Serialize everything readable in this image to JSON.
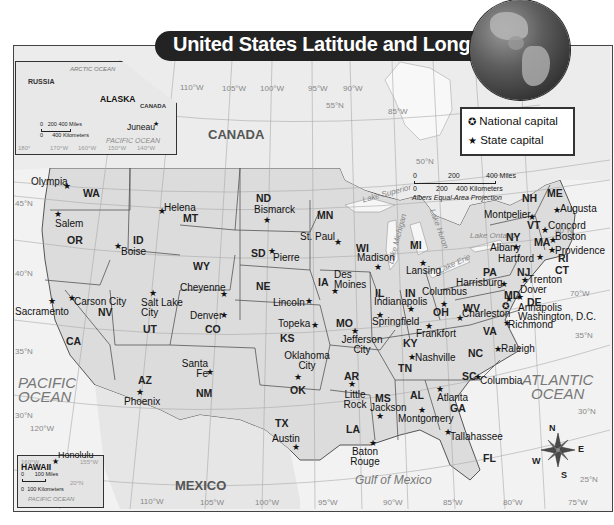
{
  "title": "United States Latitude and Longitude",
  "legend": {
    "items": [
      {
        "symbol": "national-capital-icon",
        "glyph": "✪",
        "label": "National capital"
      },
      {
        "symbol": "state-capital-icon",
        "glyph": "★",
        "label": "State capital"
      }
    ]
  },
  "scale_bar": {
    "miles": [
      "0",
      "200",
      "400 Miles"
    ],
    "kilometers": [
      "0",
      "200",
      "400 Kilometers"
    ],
    "projection": "Albers Equal-Area Projection"
  },
  "insets": {
    "alaska": {
      "state": "ALASKA",
      "neighbors": [
        "RUSSIA",
        "CANADA"
      ],
      "ocean": "PACIFIC OCEAN",
      "arctic": "ARCTIC OCEAN",
      "capital": "Juneau",
      "scale_miles": [
        "0",
        "200",
        "400 Miles"
      ],
      "scale_km": [
        "0",
        "400 Kilometers"
      ],
      "longitudes": [
        "180°",
        "170°W",
        "160°W",
        "150°W",
        "140°W"
      ]
    },
    "hawaii": {
      "state": "HAWAII",
      "capital": "Honolulu",
      "ocean": "PACIFIC OCEAN",
      "scale_miles": [
        "0",
        "100 Miles"
      ],
      "scale_km": [
        "0",
        "100 Kilometers"
      ],
      "longitudes": [
        "160°W",
        "155°W"
      ],
      "latitude": "20°N"
    }
  },
  "countries": [
    "CANADA",
    "MEXICO"
  ],
  "water_bodies": {
    "pacific": [
      "PACIFIC",
      "OCEAN"
    ],
    "atlantic": [
      "ATLANTIC",
      "OCEAN"
    ],
    "gulf": "Gulf of Mexico",
    "lakes": [
      "Lake Superior",
      "Lake Michigan",
      "Lake Huron",
      "Lake Erie",
      "Lake Ontario"
    ]
  },
  "gridlines": {
    "longitudes_top": [
      "110°W",
      "105°W",
      "100°W",
      "95°W",
      "90°W",
      "85°W"
    ],
    "longitudes_bottom": [
      "120°W",
      "110°W",
      "105°W",
      "100°W",
      "95°W",
      "90°W",
      "85°W",
      "80°W",
      "75°W",
      "70°W"
    ],
    "latitudes": [
      "55°N",
      "50°N",
      "45°N",
      "40°N",
      "35°N",
      "30°N",
      "25°N"
    ]
  },
  "compass": {
    "n": "N",
    "e": "E",
    "s": "S",
    "w": "W"
  },
  "states": [
    {
      "abbr": "WA",
      "capital": "Olympia"
    },
    {
      "abbr": "OR",
      "capital": "Salem"
    },
    {
      "abbr": "CA",
      "capital": "Sacramento"
    },
    {
      "abbr": "NV",
      "capital": "Carson City"
    },
    {
      "abbr": "ID",
      "capital": "Boise"
    },
    {
      "abbr": "MT",
      "capital": "Helena"
    },
    {
      "abbr": "WY",
      "capital": "Cheyenne"
    },
    {
      "abbr": "UT",
      "capital": "Salt Lake City"
    },
    {
      "abbr": "CO",
      "capital": "Denver"
    },
    {
      "abbr": "AZ",
      "capital": "Phoenix"
    },
    {
      "abbr": "NM",
      "capital": "Santa Fe"
    },
    {
      "abbr": "ND",
      "capital": "Bismarck"
    },
    {
      "abbr": "SD",
      "capital": "Pierre"
    },
    {
      "abbr": "NE",
      "capital": "Lincoln"
    },
    {
      "abbr": "KS",
      "capital": "Topeka"
    },
    {
      "abbr": "OK",
      "capital": "Oklahoma City"
    },
    {
      "abbr": "TX",
      "capital": "Austin"
    },
    {
      "abbr": "MN",
      "capital": "St. Paul"
    },
    {
      "abbr": "IA",
      "capital": "Des Moines"
    },
    {
      "abbr": "MO",
      "capital": "Jefferson City"
    },
    {
      "abbr": "AR",
      "capital": "Little Rock"
    },
    {
      "abbr": "LA",
      "capital": "Baton Rouge"
    },
    {
      "abbr": "WI",
      "capital": "Madison"
    },
    {
      "abbr": "IL",
      "capital": "Springfield"
    },
    {
      "abbr": "MS",
      "capital": "Jackson"
    },
    {
      "abbr": "MI",
      "capital": "Lansing"
    },
    {
      "abbr": "IN",
      "capital": "Indianapolis"
    },
    {
      "abbr": "KY",
      "capital": "Frankfort"
    },
    {
      "abbr": "TN",
      "capital": "Nashville"
    },
    {
      "abbr": "AL",
      "capital": "Montgomery"
    },
    {
      "abbr": "OH",
      "capital": "Columbus"
    },
    {
      "abbr": "GA",
      "capital": "Atlanta"
    },
    {
      "abbr": "FL",
      "capital": "Tallahassee"
    },
    {
      "abbr": "SC",
      "capital": "Columbia"
    },
    {
      "abbr": "NC",
      "capital": "Raleigh"
    },
    {
      "abbr": "VA",
      "capital": "Richmond"
    },
    {
      "abbr": "WV",
      "capital": "Charleston"
    },
    {
      "abbr": "PA",
      "capital": "Harrisburg"
    },
    {
      "abbr": "MD",
      "capital": "Annapolis"
    },
    {
      "abbr": "DE",
      "capital": "Dover"
    },
    {
      "abbr": "NJ",
      "capital": "Trenton"
    },
    {
      "abbr": "NY",
      "capital": "Albany"
    },
    {
      "abbr": "CT",
      "capital": "Hartford"
    },
    {
      "abbr": "RI",
      "capital": "Providence"
    },
    {
      "abbr": "MA",
      "capital": "Boston"
    },
    {
      "abbr": "VT",
      "capital": "Montpelier"
    },
    {
      "abbr": "NH",
      "capital": "Concord"
    },
    {
      "abbr": "ME",
      "capital": "Augusta"
    }
  ],
  "national_capital": "Washington, D.C."
}
